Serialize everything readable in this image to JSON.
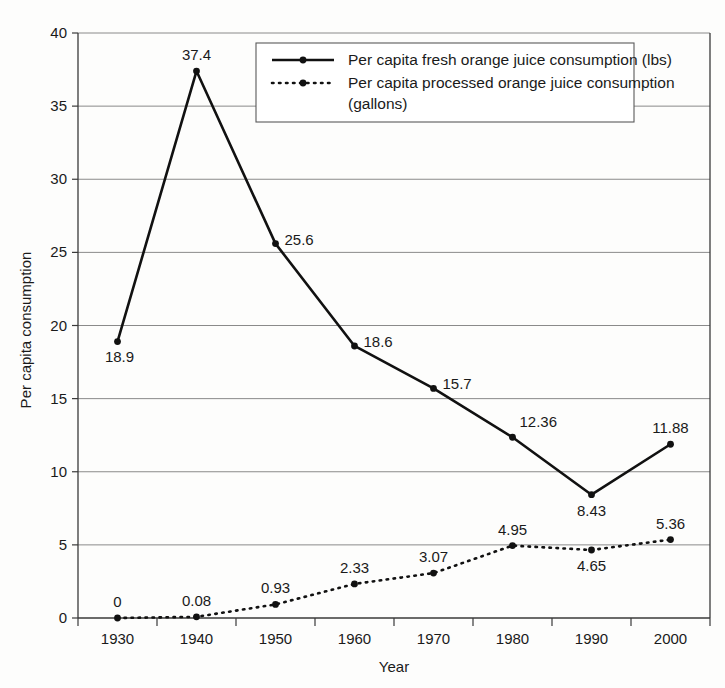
{
  "chart_data": {
    "type": "line",
    "title": "",
    "xlabel": "Year",
    "ylabel": "Per capita consumption",
    "categories": [
      "1930",
      "1940",
      "1950",
      "1960",
      "1970",
      "1980",
      "1990",
      "2000"
    ],
    "ylim": [
      0,
      40
    ],
    "yticks": [
      "0",
      "5",
      "10",
      "15",
      "20",
      "25",
      "30",
      "35",
      "40"
    ],
    "grid": "horizontal",
    "legend_position": "top-right-inside",
    "series": [
      {
        "name": "Per capita fresh orange juice consumption (lbs)",
        "style": "solid",
        "values": [
          18.9,
          37.4,
          25.6,
          18.6,
          15.7,
          12.36,
          8.43,
          11.88
        ],
        "labels": [
          "18.9",
          "37.4",
          "25.6",
          "18.6",
          "15.7",
          "12.36",
          "8.43",
          "11.88"
        ],
        "label_positions": [
          "below-left",
          "above",
          "right",
          "right",
          "right",
          "above-right",
          "below",
          "above"
        ]
      },
      {
        "name": "Per capita processed orange juice consumption (gallons)",
        "style": "dotted",
        "values": [
          0,
          0.08,
          0.93,
          2.33,
          3.07,
          4.95,
          4.65,
          5.36
        ],
        "labels": [
          "0",
          "0.08",
          "0.93",
          "2.33",
          "3.07",
          "4.95",
          "4.65",
          "5.36"
        ],
        "label_positions": [
          "above",
          "above",
          "above",
          "above",
          "above",
          "above",
          "below",
          "above"
        ]
      }
    ],
    "legend_entries": [
      "Per capita fresh orange juice consumption (lbs)",
      "Per capita processed orange juice consumption",
      "(gallons)"
    ]
  },
  "colors": {
    "line": "#111111",
    "grid": "#8a8a8a",
    "axis": "#3a3a3a",
    "background": "#fdfdfc",
    "text": "#1a1a1a"
  }
}
